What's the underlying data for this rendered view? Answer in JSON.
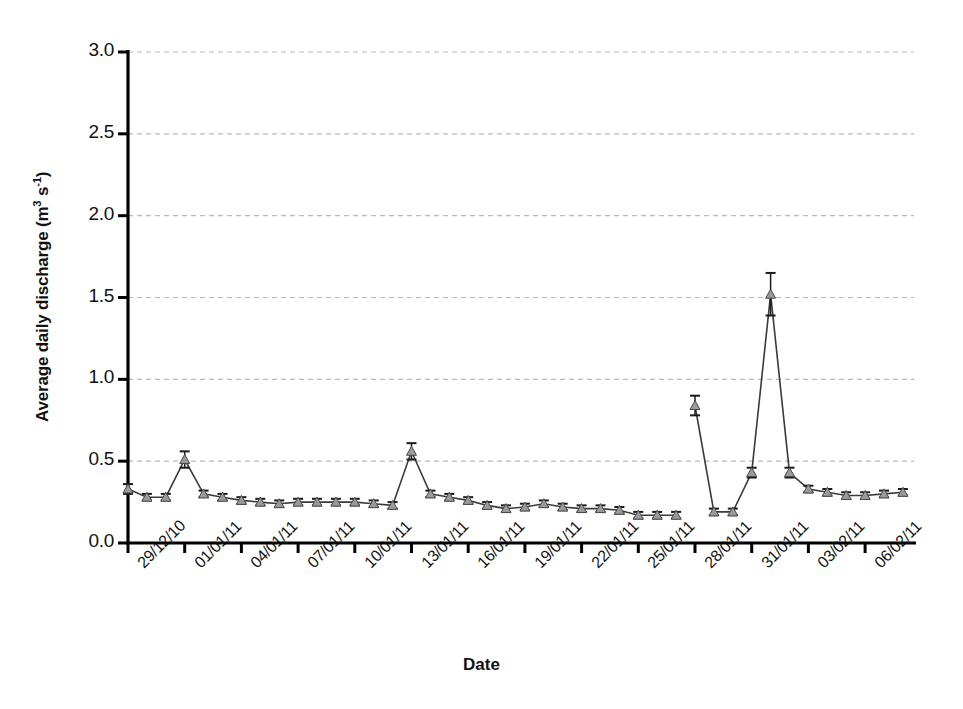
{
  "chart_data": {
    "type": "line",
    "title": "",
    "xlabel": "Date",
    "ylabel": "Average daily discharge (m3 s-1)",
    "ylabel_parts": {
      "main": "Average daily discharge (m",
      "sup1": "3",
      "mid": " s",
      "sup2": "-1",
      "end": ")"
    },
    "ylim": [
      0.0,
      3.0
    ],
    "yticks": [
      "0.0",
      "0.5",
      "1.0",
      "1.5",
      "2.0",
      "2.5",
      "3.0"
    ],
    "ytick_values": [
      0.0,
      0.5,
      1.0,
      1.5,
      2.0,
      2.5,
      3.0
    ],
    "grid": "horizontal-dashed",
    "legend": "none",
    "marker": "triangle",
    "marker_color": "#9a9a9a",
    "line_color": "#3a3a3a",
    "error_bars": true,
    "xtick_labels": [
      "29/12/10",
      "01/01/11",
      "04/01/11",
      "07/01/11",
      "10/01/11",
      "13/01/11",
      "16/01/11",
      "19/01/11",
      "22/01/11",
      "25/01/11",
      "28/01/11",
      "31/01/11",
      "03/02/11",
      "06/02/11"
    ],
    "xtick_day_indices": [
      0,
      3,
      6,
      9,
      12,
      15,
      18,
      21,
      24,
      27,
      30,
      33,
      36,
      39
    ],
    "x": [
      "29/12/10",
      "30/12/10",
      "31/12/10",
      "01/01/11",
      "02/01/11",
      "03/01/11",
      "04/01/11",
      "05/01/11",
      "06/01/11",
      "07/01/11",
      "08/01/11",
      "09/01/11",
      "10/01/11",
      "11/01/11",
      "12/01/11",
      "13/01/11",
      "14/01/11",
      "15/01/11",
      "16/01/11",
      "17/01/11",
      "18/01/11",
      "19/01/11",
      "20/01/11",
      "21/01/11",
      "22/01/11",
      "23/01/11",
      "24/01/11",
      "25/01/11",
      "26/01/11",
      "27/01/11",
      "28/01/11",
      "29/01/11",
      "30/01/11",
      "31/01/11",
      "01/02/11",
      "02/02/11",
      "03/02/11",
      "04/02/11",
      "05/02/11",
      "06/02/11",
      "07/02/11",
      "08/02/11"
    ],
    "values": [
      0.33,
      0.28,
      0.28,
      0.51,
      0.3,
      0.28,
      0.26,
      0.25,
      0.24,
      0.25,
      0.25,
      0.25,
      0.25,
      0.24,
      0.23,
      0.56,
      0.3,
      0.28,
      0.26,
      0.23,
      0.21,
      0.22,
      0.24,
      0.22,
      0.21,
      0.21,
      0.2,
      0.17,
      0.17,
      0.17,
      0.84,
      0.19,
      0.19,
      0.43,
      1.52,
      0.43,
      0.33,
      0.31,
      0.29,
      0.29,
      0.3,
      0.31
    ],
    "errors": [
      0.03,
      0.02,
      0.02,
      0.05,
      0.02,
      0.02,
      0.02,
      0.02,
      0.02,
      0.02,
      0.02,
      0.02,
      0.02,
      0.02,
      0.02,
      0.05,
      0.02,
      0.02,
      0.02,
      0.02,
      0.02,
      0.02,
      0.02,
      0.02,
      0.02,
      0.02,
      0.02,
      0.02,
      0.02,
      0.02,
      0.06,
      0.02,
      0.02,
      0.03,
      0.13,
      0.03,
      0.02,
      0.02,
      0.02,
      0.02,
      0.02,
      0.02
    ],
    "line_breaks_after": [
      29
    ],
    "axis_color": "#000000",
    "grid_color": "#b9b9b9"
  }
}
